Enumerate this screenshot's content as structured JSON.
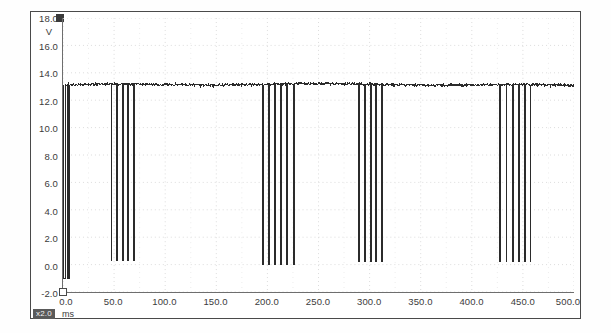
{
  "figure": {
    "title": "",
    "channel_marker": "channel-1-marker",
    "zoom_badge": "x2.0",
    "x_unit": "ms",
    "y_unit": "V"
  },
  "axes": {
    "y_ticks": [
      "18.0",
      "16.0",
      "14.0",
      "12.0",
      "10.0",
      "8.0",
      "6.0",
      "4.0",
      "2.0",
      "0.0",
      "-2.0"
    ],
    "x_ticks": [
      "0.0",
      "50.0",
      "100.0",
      "150.0",
      "200.0",
      "250.0",
      "300.0",
      "350.0",
      "400.0",
      "450.0",
      "500.0"
    ],
    "grid_color": "#e0e0e0",
    "axis_color": "#6e6e6e",
    "trace_color": "#2b2b2b"
  },
  "chart_data": {
    "type": "line",
    "title": "",
    "xlabel": "ms",
    "ylabel": "V",
    "xlim": [
      0,
      500
    ],
    "ylim": [
      -2,
      18
    ],
    "grid": true,
    "legend": "none",
    "series": [
      {
        "name": "Voltage",
        "description": "Battery / supply voltage trace with injector-style pulldown spikes grouped in four bursts",
        "baseline_v": 13.1,
        "baseline_noise_v": 0.15,
        "spike_low_v": 0.3,
        "pulse_bursts": [
          {
            "burst": 1,
            "kind": "wide-pulse-pair",
            "events_ms": [
              1.5,
              5.5
            ],
            "low_v": -1.0,
            "width_ms": 1.2
          },
          {
            "burst": 1,
            "kind": "narrow-spikes",
            "events_ms": [
              47.5,
              53.0,
              58.5,
              64.0,
              69.5
            ],
            "low_v": 0.3,
            "width_ms": 0.7
          },
          {
            "burst": 2,
            "kind": "narrow-spikes",
            "events_ms": [
              196.0,
              201.5,
              207.5,
              213.5,
              219.5,
              226.0
            ],
            "low_v": 0.0,
            "width_ms": 0.7
          },
          {
            "burst": 3,
            "kind": "narrow-spikes",
            "events_ms": [
              290.0,
              295.5,
              301.0,
              306.5,
              312.0
            ],
            "low_v": 0.2,
            "width_ms": 0.7
          },
          {
            "burst": 4,
            "kind": "narrow-spikes",
            "events_ms": [
              428.0,
              434.0,
              440.0,
              446.0,
              452.0,
              457.5
            ],
            "low_v": 0.2,
            "width_ms": 0.7
          }
        ]
      }
    ]
  }
}
